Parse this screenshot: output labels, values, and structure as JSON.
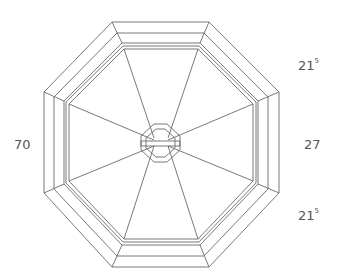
{
  "diagram": {
    "stroke_color": "#666666",
    "background": "#ffffff"
  },
  "labels": {
    "left": {
      "main": "70",
      "sup": ""
    },
    "right_top": {
      "main": "21",
      "sup": "5"
    },
    "right_middle": {
      "main": "27",
      "sup": ""
    },
    "right_bottom": {
      "main": "21",
      "sup": "5"
    }
  }
}
